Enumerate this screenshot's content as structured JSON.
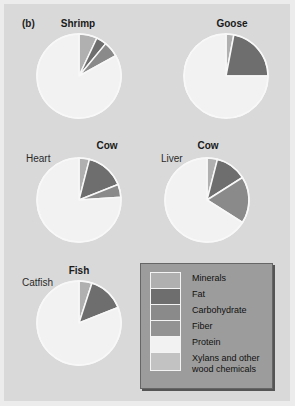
{
  "panel_label": "(b)",
  "chart_data": {
    "type": "pie",
    "title": "(b)",
    "legend": {
      "placement": "bottom-right",
      "entries": [
        {
          "key": "minerals",
          "label": "Minerals",
          "color": "#b0b0b0"
        },
        {
          "key": "fat",
          "label": "Fat",
          "color": "#6e6e6e"
        },
        {
          "key": "carbohydrate",
          "label": "Carbohydrate",
          "color": "#8a8a8a"
        },
        {
          "key": "fiber",
          "label": "Fiber",
          "color": "#939393"
        },
        {
          "key": "protein",
          "label": "Protein",
          "color": "#f2f2f2"
        },
        {
          "key": "xylans",
          "label": "Xylans and other wood chemicals",
          "color": "#c2c2c2"
        }
      ]
    },
    "pies": [
      {
        "title": "Shrimp",
        "subtitle": "",
        "slices": [
          {
            "key": "minerals",
            "value": 7
          },
          {
            "key": "fat",
            "value": 4
          },
          {
            "key": "carbohydrate",
            "value": 6
          },
          {
            "key": "protein",
            "value": 83
          }
        ]
      },
      {
        "title": "Goose",
        "subtitle": "",
        "slices": [
          {
            "key": "minerals",
            "value": 3
          },
          {
            "key": "fat",
            "value": 22
          },
          {
            "key": "protein",
            "value": 75
          }
        ]
      },
      {
        "title": "Cow",
        "subtitle": "Heart",
        "slices": [
          {
            "key": "minerals",
            "value": 4
          },
          {
            "key": "fat",
            "value": 15
          },
          {
            "key": "carbohydrate",
            "value": 5
          },
          {
            "key": "protein",
            "value": 76
          }
        ]
      },
      {
        "title": "Cow",
        "subtitle": "Liver",
        "slices": [
          {
            "key": "minerals",
            "value": 4
          },
          {
            "key": "fat",
            "value": 12
          },
          {
            "key": "carbohydrate",
            "value": 18
          },
          {
            "key": "protein",
            "value": 66
          }
        ]
      },
      {
        "title": "Fish",
        "subtitle": "Catfish",
        "slices": [
          {
            "key": "minerals",
            "value": 5
          },
          {
            "key": "fat",
            "value": 14
          },
          {
            "key": "protein",
            "value": 81
          }
        ]
      }
    ]
  }
}
